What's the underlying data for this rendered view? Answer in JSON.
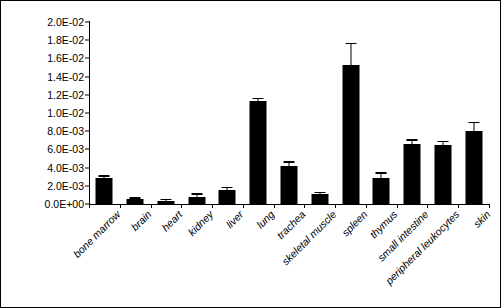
{
  "chart_data": {
    "type": "bar",
    "title": "",
    "xlabel": "",
    "ylabel": "ORAI1/GAPDH",
    "ylim": [
      0,
      0.02
    ],
    "ytick_values": [
      0,
      0.002,
      0.004,
      0.006,
      0.008,
      0.01,
      0.012,
      0.014,
      0.016,
      0.018,
      0.02
    ],
    "ytick_labels": [
      "0.0E+00",
      "2.0E-03",
      "4.0E-03",
      "6.0E-03",
      "8.0E-03",
      "1.0E-02",
      "1.2E-02",
      "1.4E-02",
      "1.6E-02",
      "1.8E-02",
      "2.0E-02"
    ],
    "grid": false,
    "legend": false,
    "bar_color": "#000000",
    "categories": [
      "bone marrow",
      "brain",
      "heart",
      "kidney",
      "liver",
      "lung",
      "trachea",
      "skeletal muscle",
      "spleen",
      "thymus",
      "small intestine",
      "peripheral leukocytes",
      "skin"
    ],
    "values": [
      0.0029,
      0.0005,
      0.00035,
      0.0008,
      0.0015,
      0.0113,
      0.0042,
      0.00105,
      0.0153,
      0.0029,
      0.0066,
      0.0065,
      0.008
    ],
    "errors": [
      0.00012,
      8e-05,
      6e-05,
      0.00022,
      0.00022,
      0.00022,
      0.00032,
      0.00015,
      0.00225,
      0.00045,
      0.00035,
      0.0003,
      0.0009
    ]
  }
}
